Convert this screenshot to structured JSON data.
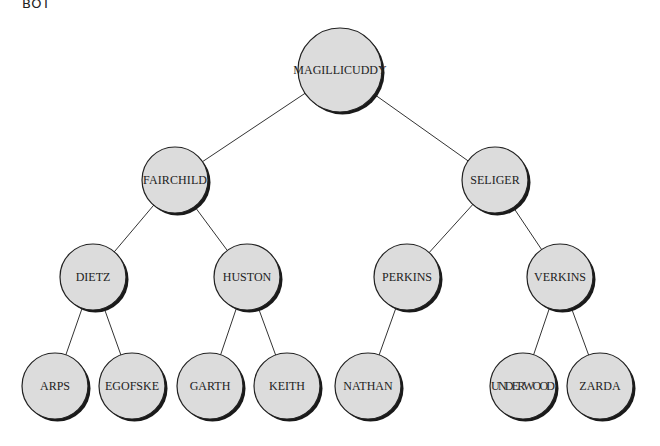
{
  "corner_label": "BOT",
  "colors": {
    "node_fill": "#dcdcdc",
    "node_stroke": "#222222",
    "shadow": "#1a1a1a",
    "edge": "#333333"
  },
  "nodes": [
    {
      "id": "magillicuddy",
      "label": "MAGILLICUDDY",
      "x": 340,
      "y": 70,
      "r": 42
    },
    {
      "id": "fairchild",
      "label": "FAIRCHILD",
      "x": 175,
      "y": 180,
      "r": 33
    },
    {
      "id": "seliger",
      "label": "SELIGER",
      "x": 495,
      "y": 180,
      "r": 33
    },
    {
      "id": "dietz",
      "label": "DIETZ",
      "x": 93,
      "y": 277,
      "r": 33
    },
    {
      "id": "huston",
      "label": "HUSTON",
      "x": 247,
      "y": 277,
      "r": 33
    },
    {
      "id": "perkins",
      "label": "PERKINS",
      "x": 407,
      "y": 277,
      "r": 33
    },
    {
      "id": "verkins",
      "label": "VERKINS",
      "x": 560,
      "y": 277,
      "r": 33
    },
    {
      "id": "arps",
      "label": "ARPS",
      "x": 55,
      "y": 386,
      "r": 33
    },
    {
      "id": "egofske",
      "label": "EGOFSKE",
      "x": 132,
      "y": 386,
      "r": 33
    },
    {
      "id": "garth",
      "label": "GARTH",
      "x": 210,
      "y": 386,
      "r": 33
    },
    {
      "id": "keith",
      "label": "KEITH",
      "x": 287,
      "y": 386,
      "r": 33
    },
    {
      "id": "nathan",
      "label": "NATHAN",
      "x": 368,
      "y": 386,
      "r": 33
    },
    {
      "id": "underwood",
      "label": "UNDERWOOD",
      "x": 523,
      "y": 386,
      "r": 33
    },
    {
      "id": "zarda",
      "label": "ZARDA",
      "x": 600,
      "y": 386,
      "r": 33
    }
  ],
  "edges": [
    [
      "magillicuddy",
      "fairchild"
    ],
    [
      "magillicuddy",
      "seliger"
    ],
    [
      "fairchild",
      "dietz"
    ],
    [
      "fairchild",
      "huston"
    ],
    [
      "seliger",
      "perkins"
    ],
    [
      "seliger",
      "verkins"
    ],
    [
      "dietz",
      "arps"
    ],
    [
      "dietz",
      "egofske"
    ],
    [
      "huston",
      "garth"
    ],
    [
      "huston",
      "keith"
    ],
    [
      "perkins",
      "nathan"
    ],
    [
      "verkins",
      "underwood"
    ],
    [
      "verkins",
      "zarda"
    ]
  ]
}
